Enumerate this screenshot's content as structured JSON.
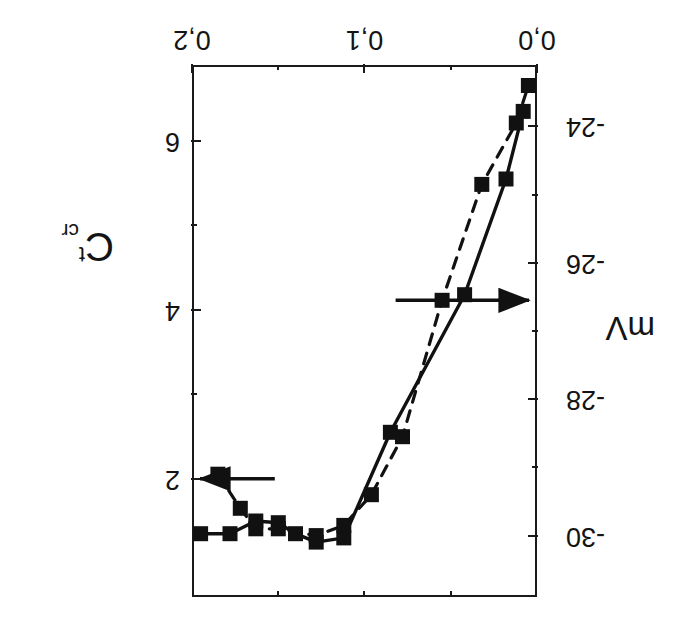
{
  "figure": {
    "orientation": "rotated-180",
    "background": "#ffffff",
    "ink_color": "#1a1a1a"
  },
  "chart_data": {
    "type": "line",
    "title": "",
    "subtitle": "",
    "orientation_note": "Figure is printed upside down (rotated 180 degrees)",
    "xlabel": "",
    "xlim": [
      0.0,
      0.2
    ],
    "x_ticks_major": [
      0.0,
      0.1,
      0.2
    ],
    "x_tick_labels": [
      "0,0",
      "0,1",
      "0,2"
    ],
    "x_ticks_minor": [
      0.05,
      0.15
    ],
    "grid": false,
    "legend_position": "none",
    "axes": [
      {
        "id": "left",
        "label": "C",
        "label_superscript": "t",
        "label_subscript": "cr",
        "label_full": "C t cr",
        "ylim": [
          0.6,
          6.9
        ],
        "ticks_major": [
          2,
          4,
          6
        ],
        "tick_labels": [
          "2",
          "4",
          "6"
        ],
        "ticks_minor": [
          3,
          5
        ],
        "direction": "increasing-downward"
      },
      {
        "id": "right",
        "label": "mV",
        "ylim": [
          -30.9,
          -23.1
        ],
        "ticks_major": [
          -30,
          -28,
          -26,
          -24
        ],
        "tick_labels": [
          "-30",
          "-28",
          "-26",
          "-24"
        ],
        "ticks_minor": [
          -29,
          -27,
          -25
        ],
        "direction": "increasing-downward"
      }
    ],
    "series": [
      {
        "name": "Ct_cr",
        "axis": "left",
        "style": "solid",
        "marker": "filled-square",
        "arrow": "left",
        "arrow_label": "points to left axis",
        "x": [
          0.195,
          0.178,
          0.163,
          0.15,
          0.14,
          0.128,
          0.112,
          0.085,
          0.042,
          0.018,
          0.008
        ],
        "y": [
          1.35,
          1.35,
          1.5,
          1.48,
          1.35,
          1.25,
          1.3,
          2.55,
          4.18,
          5.55,
          6.35
        ]
      },
      {
        "name": "mV",
        "axis": "right",
        "style": "dashed",
        "marker": "filled-square",
        "arrow": "right",
        "arrow_label": "points to right axis",
        "x": [
          0.185,
          0.172,
          0.163,
          0.15,
          0.128,
          0.112,
          0.096,
          0.078,
          0.055,
          0.032,
          0.012,
          0.005
        ],
        "y": [
          -29.1,
          -29.6,
          -29.9,
          -29.9,
          -30.0,
          -29.85,
          -29.4,
          -28.55,
          -26.55,
          -24.85,
          -23.95,
          -23.4
        ]
      }
    ],
    "annotations": [
      {
        "type": "arrow",
        "direction": "left",
        "from_x": 0.152,
        "from_y_axis": "left",
        "note": "arrow from Ct_cr curve toward left axis"
      },
      {
        "type": "arrow",
        "direction": "right",
        "from_x": 0.082,
        "from_y_axis": "right",
        "note": "arrow from mV curve toward right axis"
      }
    ]
  }
}
